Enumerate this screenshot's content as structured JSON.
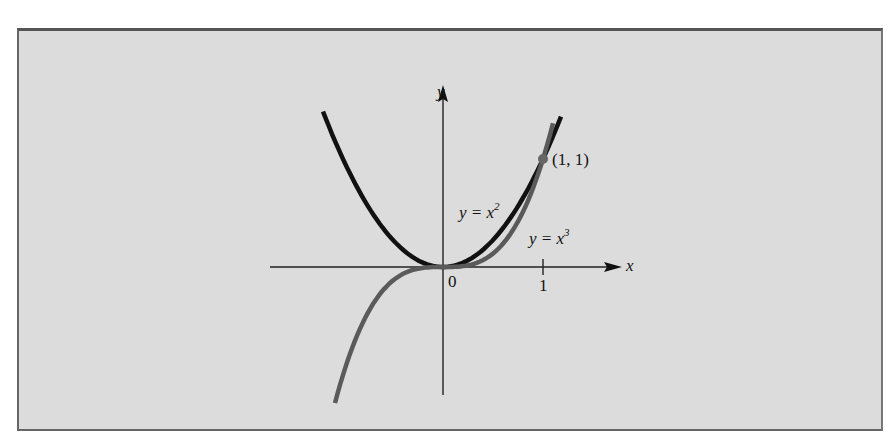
{
  "figure": {
    "axis_x_label": "x",
    "axis_y_label": "y",
    "origin_label": "0",
    "tick_x1_label": "1",
    "point_label": "(1, 1)",
    "curve1": {
      "lhs": "y = x",
      "exp": "2"
    },
    "curve2": {
      "lhs": "y = x",
      "exp": "3"
    },
    "colors": {
      "background": "#dcdcdc",
      "parabola": "#111111",
      "cubic": "#5a5a5a",
      "axes": "#222222"
    }
  },
  "chart_data": {
    "type": "line",
    "title": "",
    "xlabel": "x",
    "ylabel": "y",
    "xlim": [
      -1.7,
      1.8
    ],
    "ylim": [
      -1.2,
      1.7
    ],
    "grid": false,
    "series": [
      {
        "name": "y = x^2",
        "x": [
          -1.2,
          -1,
          -0.5,
          0,
          0.5,
          1,
          1.18
        ],
        "y": [
          1.44,
          1,
          0.25,
          0,
          0.25,
          1,
          1.39
        ]
      },
      {
        "name": "y = x^3",
        "x": [
          -1.08,
          -1,
          -0.5,
          0,
          0.5,
          1,
          1.1
        ],
        "y": [
          -1.26,
          -1,
          -0.125,
          0,
          0.125,
          1,
          1.33
        ]
      }
    ],
    "annotations": [
      {
        "text": "(1, 1)",
        "x": 1,
        "y": 1,
        "marker": "point"
      },
      {
        "text": "0",
        "x": 0,
        "y": 0
      },
      {
        "text": "1",
        "x": 1,
        "y": 0,
        "tick": true
      }
    ]
  }
}
